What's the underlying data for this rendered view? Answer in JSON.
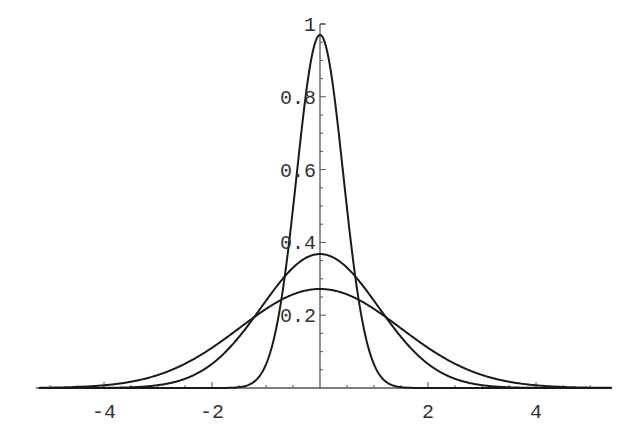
{
  "chart_data": {
    "type": "line",
    "title": "",
    "xlabel": "",
    "ylabel": "",
    "xlim": [
      -5.2,
      5.4
    ],
    "ylim": [
      0,
      1.0
    ],
    "grid": false,
    "legend": null,
    "x_ticks": [
      -4,
      -2,
      2,
      4
    ],
    "x_tick_labels": [
      "-4",
      "-2",
      "2",
      "4"
    ],
    "y_ticks": [
      0.2,
      0.4,
      0.6,
      0.8,
      1
    ],
    "y_tick_labels": [
      "0.2",
      "0.4",
      "0.6",
      "0.8",
      "1"
    ],
    "series": [
      {
        "name": "narrow",
        "shape": "gaussian",
        "peak": 0.97,
        "sigma": 0.43,
        "center": 0
      },
      {
        "name": "medium",
        "shape": "gaussian",
        "peak": 0.368,
        "sigma": 1.08,
        "center": 0
      },
      {
        "name": "wide",
        "shape": "gaussian",
        "peak": 0.272,
        "sigma": 1.49,
        "center": 0
      }
    ],
    "sample_points": {
      "x": [
        -4,
        -3,
        -2,
        -1.5,
        -1,
        -0.5,
        0,
        0.5,
        1,
        1.5,
        2,
        3,
        4
      ],
      "narrow": [
        0.0,
        0.0,
        0.0,
        0.002,
        0.067,
        0.49,
        0.97,
        0.49,
        0.067,
        0.002,
        0.0,
        0.0,
        0.0
      ],
      "medium": [
        0.0004,
        0.007,
        0.066,
        0.14,
        0.241,
        0.331,
        0.368,
        0.331,
        0.241,
        0.14,
        0.066,
        0.007,
        0.0004
      ],
      "wide": [
        0.0074,
        0.036,
        0.11,
        0.163,
        0.216,
        0.257,
        0.272,
        0.257,
        0.216,
        0.163,
        0.11,
        0.036,
        0.0074
      ]
    }
  },
  "colors": {
    "line": "#1a1a1a",
    "axis": "#555555",
    "text": "#333333",
    "background": "#ffffff"
  }
}
